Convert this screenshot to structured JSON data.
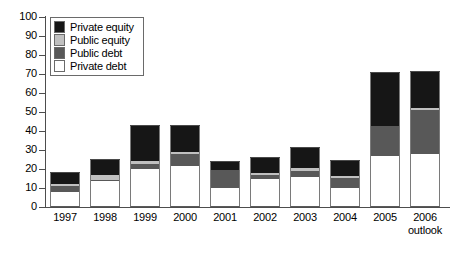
{
  "chart_data": {
    "type": "bar",
    "stacked": true,
    "title": "",
    "subtitle": "",
    "xlabel": "",
    "ylabel": "",
    "ylim": [
      0,
      100
    ],
    "yticks": [
      0,
      10,
      20,
      30,
      40,
      50,
      60,
      70,
      80,
      90,
      100
    ],
    "ytick_labels": [
      "0",
      "10",
      "20",
      "30",
      "40",
      "50",
      "60",
      "70",
      "80",
      "90",
      "100"
    ],
    "grid": false,
    "legend_position": "top-left",
    "categories": [
      "1997",
      "1998",
      "1999",
      "2000",
      "2001",
      "2002",
      "2003",
      "2004",
      "2005",
      "2006"
    ],
    "category_sublabels": [
      "",
      "",
      "",
      "",
      "",
      "",
      "",
      "",
      "",
      "outlook"
    ],
    "series": [
      {
        "name": "Private debt",
        "color": "#ffffff",
        "values": [
          8,
          13.5,
          20,
          21.5,
          10,
          14.5,
          16,
          10,
          27,
          28
        ]
      },
      {
        "name": "Public debt",
        "color": "#585858",
        "values": [
          3,
          0.5,
          2.5,
          6.5,
          9.5,
          2.5,
          3,
          5.5,
          15.5,
          23
        ]
      },
      {
        "name": "Public equity",
        "color": "#c0c0c0",
        "values": [
          1,
          3,
          1.5,
          1,
          0,
          1,
          1.5,
          1,
          0,
          1
        ]
      },
      {
        "name": "Private equity",
        "color": "#161616",
        "values": [
          6,
          7.5,
          18.5,
          13.5,
          4,
          8,
          10.5,
          7.5,
          28,
          19
        ]
      }
    ],
    "totals": [
      18,
      24.5,
      42.5,
      42.5,
      23.5,
      26,
      31,
      24,
      70.5,
      71
    ],
    "stack_order_bottom_to_top": [
      "Private debt",
      "Public debt",
      "Public equity",
      "Private equity"
    ]
  },
  "legend": {
    "items": [
      {
        "label": "Private equity",
        "color": "#161616"
      },
      {
        "label": "Public equity",
        "color": "#c0c0c0"
      },
      {
        "label": "Public debt",
        "color": "#585858"
      },
      {
        "label": "Private debt",
        "color": "#ffffff"
      }
    ]
  },
  "colors": {
    "axis": "#4d4d4d",
    "bar_outline": "#7a7a7a",
    "background": "#ffffff",
    "text": "#000000"
  }
}
